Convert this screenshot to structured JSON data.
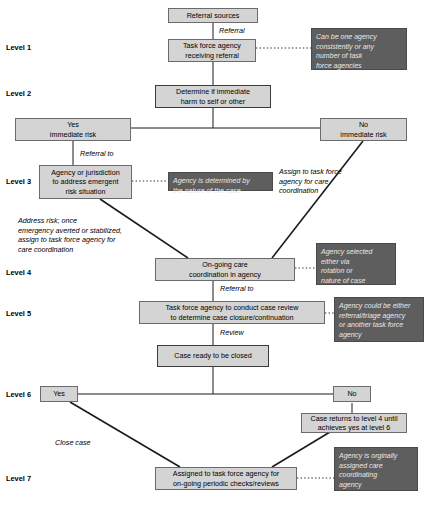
{
  "diagram": {
    "colors": {
      "node_fill": "#d4d4d4",
      "node_border": "#6b6b6b",
      "note_fill": "#5e5e5e",
      "note_text": "#e8e8e8",
      "line": "#1a1a1a",
      "background": "#ffffff"
    }
  },
  "levels": [
    {
      "label": "Level 1"
    },
    {
      "label": "Level 2"
    },
    {
      "label": "Level 3"
    },
    {
      "label": "Level 4"
    },
    {
      "label": "Level 5"
    },
    {
      "label": "Level 6"
    },
    {
      "label": "Level 7"
    }
  ],
  "nodes": [
    {
      "id": "referral_sources",
      "text": "Referral sources"
    },
    {
      "id": "task_force_receiving",
      "text": "Task force agency receiving referral"
    },
    {
      "id": "determine_harm",
      "text": "Determine if immediate harm to self or other"
    },
    {
      "id": "yes_immediate_risk",
      "text": "Yes immediate risk"
    },
    {
      "id": "no_immediate_risk",
      "text": "No immediate risk"
    },
    {
      "id": "agency_jurisdiction",
      "text": "Agency or jurisdiction to address emergent risk situation"
    },
    {
      "id": "ongoing_care",
      "text": "On-going care coordination in agency"
    },
    {
      "id": "case_review",
      "text": "Task force agency to conduct case review to determine case closure/continuation"
    },
    {
      "id": "case_ready_closed",
      "text": "Case ready to be closed"
    },
    {
      "id": "level6_yes",
      "text": "Yes"
    },
    {
      "id": "level6_no",
      "text": "No"
    },
    {
      "id": "case_returns",
      "text": "Case returns to level 4 until achieves yes at level 6"
    },
    {
      "id": "assigned_periodic",
      "text": "Assigned to task force agency for on-going periodic checks/reviews"
    }
  ],
  "node_lines": {
    "referral_sources": [
      "Referral sources"
    ],
    "task_force_receiving": [
      "Task force agency",
      "receiving referral"
    ],
    "determine_harm": [
      "Determine if immediate",
      "harm to self or other"
    ],
    "yes_immediate_risk": [
      "Yes",
      "immediate risk"
    ],
    "no_immediate_risk": [
      "No",
      "immediate risk"
    ],
    "agency_jurisdiction": [
      "Agency or jurisdiction",
      "to address emergent",
      "risk situation"
    ],
    "ongoing_care": [
      "On-going care",
      "coordination in agency"
    ],
    "case_review": [
      "Task force agency to conduct case review",
      "to determine case closure/continuation"
    ],
    "case_ready_closed": [
      "Case ready to be closed"
    ],
    "level6_yes": [
      "Yes"
    ],
    "level6_no": [
      "No"
    ],
    "case_returns": [
      "Case returns to level 4 until",
      "achieves yes at level 6"
    ],
    "assigned_periodic": [
      "Assigned to task force agency for",
      "on-going periodic checks/reviews"
    ]
  },
  "notes": [
    {
      "id": "note_level1",
      "text": "Can be one agency consistently or any number of task force agencies"
    },
    {
      "id": "note_level3",
      "text": "Agency is determined by the nature of the case"
    },
    {
      "id": "note_level4",
      "text": "Agency selected either via rotation or nature of case"
    },
    {
      "id": "note_level5",
      "text": "Agency could be either referral/triage agency or another task force agency"
    },
    {
      "id": "note_level7",
      "text": "Agency is orginally assigned care coordinating agency"
    }
  ],
  "note_lines": {
    "note_level1": [
      "Can be one agency",
      "consistently or any",
      "number of task",
      "force agencies"
    ],
    "note_level3": [
      "Agency is determined by",
      "the nature of the case"
    ],
    "note_level4": [
      "Agency selected",
      "either via",
      "rotation or",
      "nature of case"
    ],
    "note_level5": [
      "Agency could be either",
      "referral/triage agency",
      "or another task force",
      "agency"
    ],
    "note_level7": [
      "Agency is orginally",
      "assigned care",
      "coordinating",
      "agency"
    ]
  },
  "edge_labels": [
    {
      "id": "edge_referral",
      "text": "Referral"
    },
    {
      "id": "edge_referral_to_l3",
      "text": "Referral to"
    },
    {
      "id": "edge_assign_taskforce",
      "text": "Assign to task force agency for care coordination"
    },
    {
      "id": "edge_address_risk",
      "text": "Address risk; once emergency averted or stabilized, assign to task force agency for care coordination"
    },
    {
      "id": "edge_referral_to_l5",
      "text": "Referral to"
    },
    {
      "id": "edge_review",
      "text": "Review"
    },
    {
      "id": "edge_close_case",
      "text": "Close case"
    }
  ],
  "edge_label_lines": {
    "edge_referral": [
      "Referral"
    ],
    "edge_referral_to_l3": [
      "Referral to"
    ],
    "edge_assign_taskforce": [
      "Assign to task force",
      "agency for care",
      "coordination"
    ],
    "edge_address_risk": [
      "Address risk; once",
      "emergency averted or stabilized,",
      "assign to task force agency for",
      "care coordination"
    ],
    "edge_referral_to_l5": [
      "Referral to"
    ],
    "edge_review": [
      "Review"
    ],
    "edge_close_case": [
      "Close case"
    ]
  }
}
